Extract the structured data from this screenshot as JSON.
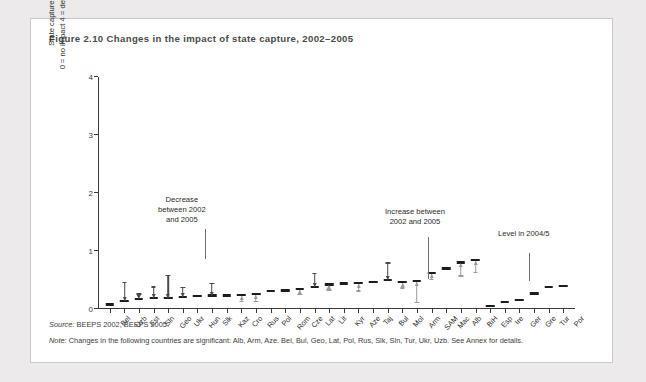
{
  "figure": {
    "title": "Figure 2.10  Changes in the impact of state capture, 2002–2005",
    "source_label": "Source:",
    "source_text": "BEEPS 2002, BEEPS 2005.",
    "note_label": "Note:",
    "note_text": "Changes in the following countries are significant: Alb, Arm, Aze. Bel, Bul, Geo, Lat, Pol, Rus, Slk, Sln, Tur, Ukr, Uzb. See Annex for details."
  },
  "annotations": [
    {
      "name": "decrease",
      "lines": [
        "Decrease",
        "between 2002",
        "and 2005"
      ]
    },
    {
      "name": "increase",
      "lines": [
        "Increase between",
        "2002 and 2005"
      ]
    },
    {
      "name": "level",
      "lines": [
        "Level in 2004/5"
      ]
    }
  ],
  "colors": {
    "bar": "#1c1c1c",
    "decrease_arrow": "#4a4a4a",
    "increase_arrow": "#9a9a9a",
    "axis": "#3a3a3a",
    "card_border": "#c9c7c7",
    "page_background": "#eceaea"
  },
  "chart_data": {
    "type": "bar",
    "title": "Changes in the impact of state capture, 2002–2005",
    "xlabel": "",
    "ylabel": "State capture index  0 = no impact  4 = decisive impact",
    "ylabel_lines": [
      "State capture index",
      "0 = no impact   4 = decisive impact"
    ],
    "ylim": [
      0,
      4
    ],
    "yticks": [
      0,
      1,
      2,
      3,
      4
    ],
    "grid": false,
    "legend": "none",
    "value_series_name": "Level in 2004/5",
    "categories": [
      "Bel",
      "Uzb",
      "Est",
      "Sln",
      "Geo",
      "Ukr",
      "Hun",
      "Slk",
      "Kaz",
      "Cro",
      "Rus",
      "Pol",
      "Rom",
      "Cze",
      "Lat",
      "Lit",
      "Kyr",
      "Aze",
      "Taj",
      "Bul",
      "Mol",
      "Arm",
      "SAM",
      "Mac",
      "Alb",
      "BiH",
      "Esp",
      "Ire",
      "Ger",
      "Gre",
      "Tur",
      "Por"
    ],
    "values": [
      0.06,
      0.12,
      0.15,
      0.17,
      0.17,
      0.19,
      0.2,
      0.21,
      0.21,
      0.22,
      0.24,
      0.29,
      0.3,
      0.32,
      0.36,
      0.4,
      0.42,
      0.43,
      0.44,
      0.48,
      0.44,
      0.46,
      0.6,
      0.68,
      0.78,
      0.82,
      0.03,
      0.1,
      0.13,
      0.25,
      0.36,
      0.38
    ],
    "changes": [
      {
        "category": "Bel",
        "direction": "none",
        "magnitude": 0
      },
      {
        "category": "Uzb",
        "direction": "decrease",
        "magnitude": 0.33
      },
      {
        "category": "Est",
        "direction": "decrease",
        "magnitude": 0.1
      },
      {
        "category": "Sln",
        "direction": "decrease",
        "magnitude": 0.2
      },
      {
        "category": "Geo",
        "direction": "decrease",
        "magnitude": 0.4
      },
      {
        "category": "Ukr",
        "direction": "decrease",
        "magnitude": 0.17
      },
      {
        "category": "Hun",
        "direction": "none",
        "magnitude": 0
      },
      {
        "category": "Slk",
        "direction": "decrease",
        "magnitude": 0.22
      },
      {
        "category": "Kaz",
        "direction": "none",
        "magnitude": 0
      },
      {
        "category": "Cro",
        "direction": "increase",
        "magnitude": 0.1
      },
      {
        "category": "Rus",
        "direction": "increase",
        "magnitude": 0.12
      },
      {
        "category": "Pol",
        "direction": "none",
        "magnitude": 0
      },
      {
        "category": "Rom",
        "direction": "none",
        "magnitude": 0
      },
      {
        "category": "Cze",
        "direction": "increase",
        "magnitude": 0.08
      },
      {
        "category": "Lat",
        "direction": "decrease",
        "magnitude": 0.24
      },
      {
        "category": "Lit",
        "direction": "increase",
        "magnitude": 0.07
      },
      {
        "category": "Kyr",
        "direction": "none",
        "magnitude": 0
      },
      {
        "category": "Aze",
        "direction": "increase",
        "magnitude": 0.13
      },
      {
        "category": "Taj",
        "direction": "none",
        "magnitude": 0
      },
      {
        "category": "Bul",
        "direction": "decrease",
        "magnitude": 0.3
      },
      {
        "category": "Mol",
        "direction": "increase",
        "magnitude": 0.09
      },
      {
        "category": "Arm",
        "direction": "increase",
        "magnitude": 0.36
      },
      {
        "category": "SAM",
        "direction": "increase",
        "magnitude": 0.1
      },
      {
        "category": "Mac",
        "direction": "none",
        "magnitude": 0
      },
      {
        "category": "Alb",
        "direction": "increase",
        "magnitude": 0.22
      },
      {
        "category": "BiH",
        "direction": "increase",
        "magnitude": 0.2
      },
      {
        "category": "Esp",
        "direction": "none",
        "magnitude": 0
      },
      {
        "category": "Ire",
        "direction": "none",
        "magnitude": 0
      },
      {
        "category": "Ger",
        "direction": "none",
        "magnitude": 0
      },
      {
        "category": "Gre",
        "direction": "none",
        "magnitude": 0
      },
      {
        "category": "Tur",
        "direction": "none",
        "magnitude": 0
      },
      {
        "category": "Por",
        "direction": "none",
        "magnitude": 0
      }
    ]
  }
}
